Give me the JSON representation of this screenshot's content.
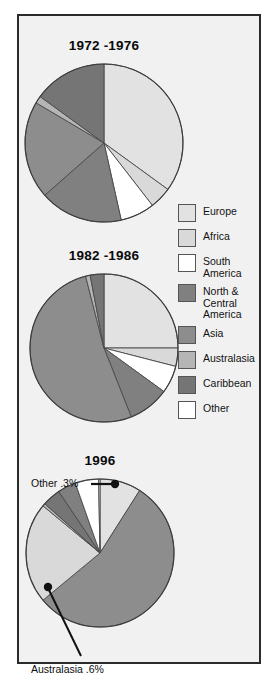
{
  "figure": {
    "background_color": "#f1f1f1",
    "border_color": "#2b2b2b"
  },
  "legend": {
    "position": "right-middle",
    "items": [
      {
        "label": "Europe",
        "color": "#e2e2e2"
      },
      {
        "label": "Africa",
        "color": "#d9d9d9"
      },
      {
        "label": "South\nAmerica",
        "color": "#ffffff"
      },
      {
        "label": "North &\nCentral\nAmerica",
        "color": "#808080"
      },
      {
        "label": "Asia",
        "color": "#8d8d8d"
      },
      {
        "label": "Australasia",
        "color": "#b5b5b5"
      },
      {
        "label": "Caribbean",
        "color": "#757575"
      },
      {
        "label": "Other",
        "color": "#ffffff"
      }
    ]
  },
  "annotations": {
    "other_1996": "Other .3%",
    "australasia_1996": "Australasia .6%"
  },
  "chart_data": [
    {
      "type": "pie",
      "title": "1972 -1976",
      "categories": [
        "Europe",
        "Africa",
        "South America",
        "North & Central America",
        "Asia",
        "Australasia",
        "Caribbean",
        "Other"
      ],
      "values": [
        35.0,
        4.5,
        7.0,
        17.0,
        20.0,
        1.5,
        15.0,
        0.0
      ],
      "colors": [
        "#e2e2e2",
        "#d9d9d9",
        "#ffffff",
        "#808080",
        "#8d8d8d",
        "#b5b5b5",
        "#757575",
        "#ffffff"
      ],
      "start_angle_deg": 0,
      "direction": "clockwise"
    },
    {
      "type": "pie",
      "title": "1982 -1986",
      "categories": [
        "Europe",
        "Africa",
        "South America",
        "North & Central America",
        "Asia",
        "Australasia",
        "Caribbean",
        "Other"
      ],
      "values": [
        25.0,
        4.0,
        6.0,
        9.0,
        52.0,
        1.0,
        3.0,
        0.0
      ],
      "colors": [
        "#e2e2e2",
        "#d9d9d9",
        "#ffffff",
        "#808080",
        "#8d8d8d",
        "#b5b5b5",
        "#757575",
        "#ffffff"
      ],
      "start_angle_deg": 0,
      "direction": "clockwise"
    },
    {
      "type": "pie",
      "title": "1996",
      "categories": [
        "Europe",
        "Asia",
        "Africa",
        "Australasia",
        "Caribbean",
        "North & Central America",
        "South America",
        "Other"
      ],
      "values": [
        9.0,
        55.0,
        22.0,
        0.6,
        4.0,
        4.0,
        5.1,
        0.3
      ],
      "colors": [
        "#e2e2e2",
        "#8d8d8d",
        "#d9d9d9",
        "#b5b5b5",
        "#757575",
        "#808080",
        "#ffffff",
        "#ffffff"
      ],
      "start_angle_deg": 0,
      "direction": "clockwise",
      "labels": [
        {
          "category": "Other",
          "text": "Other .3%"
        },
        {
          "category": "Australasia",
          "text": "Australasia .6%"
        }
      ]
    }
  ],
  "pies": [
    {
      "title": "1972 -1976",
      "cx": 84,
      "cy": 115,
      "r": 63
    },
    {
      "title": "1982 -1986",
      "cx": 84,
      "cy": 325,
      "r": 67
    },
    {
      "title": "1996",
      "cx": 80,
      "cy": 540,
      "r": 67
    }
  ]
}
